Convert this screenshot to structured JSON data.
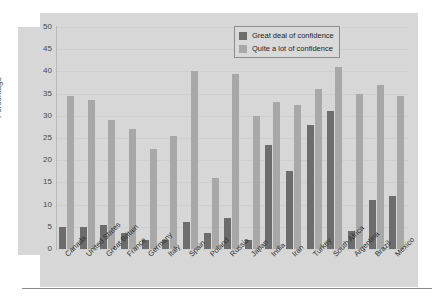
{
  "chart_data": {
    "type": "bar",
    "title": "",
    "xlabel": "",
    "ylabel": "Percentage",
    "ylim": [
      0,
      50
    ],
    "ytick_step": 5,
    "yticks": [
      50,
      45,
      40,
      35,
      30,
      25,
      20,
      15,
      10,
      5,
      0
    ],
    "grid": true,
    "legend_position": "top-right",
    "categories": [
      "Canada",
      "United States",
      "Great Britain",
      "France",
      "Germany",
      "Italy",
      "Spain",
      "Poland",
      "Russia",
      "Japan",
      "India",
      "Iran",
      "Turkey",
      "South Africa",
      "Argentina",
      "Brazil",
      "Mexico"
    ],
    "series": [
      {
        "name": "Great deal of confidence",
        "color": "#6d6d6d",
        "values": [
          5,
          5,
          5.5,
          3.5,
          2,
          2,
          6,
          3.5,
          7,
          2,
          23.5,
          17.5,
          28,
          31,
          4,
          11,
          12
        ]
      },
      {
        "name": "Quite a lot of confidence",
        "color": "#a8a8a8",
        "values": [
          34.5,
          33.5,
          29,
          27,
          22.5,
          25.5,
          40,
          16,
          39.5,
          30,
          33,
          32.5,
          36,
          41,
          35,
          37,
          34.5
        ]
      }
    ]
  },
  "axis": {
    "y_title": "Percentage"
  },
  "legend": {
    "items": [
      {
        "label": "Great deal of confidence",
        "color": "#6d6d6d"
      },
      {
        "label": "Quite a lot of confidence",
        "color": "#a8a8a8"
      }
    ]
  }
}
